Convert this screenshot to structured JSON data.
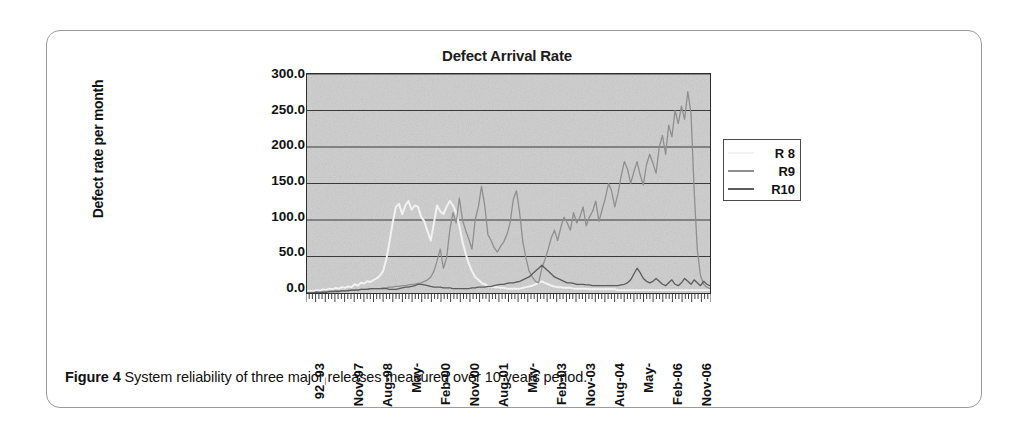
{
  "figure": {
    "caption_label": "Figure 4",
    "caption_text": "System reliability of three major releases measured over 10 years period."
  },
  "chart_data": {
    "type": "line",
    "title": "Defect Arrival Rate",
    "xlabel": "",
    "ylabel": "Defect rate per month",
    "ylim": [
      0,
      300
    ],
    "ytick_labels": [
      "300.0",
      "250.0",
      "200.0",
      "150.0",
      "100.0",
      "50.0",
      "0.0"
    ],
    "ytick_values": [
      300,
      250,
      200,
      150,
      100,
      50,
      0
    ],
    "grid": true,
    "grid_axis": "y",
    "plot_background": "#cfcfcf",
    "legend_position": "right",
    "x_tick_labels": [
      "92_93",
      "Nov-97",
      "Aug-98",
      "May-",
      "Feb-00",
      "Nov-00",
      "Aug-01",
      "May-",
      "Feb-03",
      "Nov-03",
      "Aug-04",
      "May-",
      "Feb-06",
      "Nov-06"
    ],
    "x_tick_positions": [
      0,
      12,
      21,
      30,
      39,
      48,
      57,
      66,
      75,
      84,
      93,
      102,
      111,
      120
    ],
    "n_points": 128,
    "series": [
      {
        "name": "R 8",
        "color": "#f2f2f2",
        "values": [
          2,
          3,
          2,
          4,
          3,
          5,
          4,
          6,
          5,
          7,
          6,
          8,
          7,
          9,
          8,
          12,
          10,
          14,
          13,
          16,
          15,
          18,
          20,
          24,
          30,
          46,
          70,
          96,
          118,
          122,
          108,
          120,
          126,
          114,
          120,
          118,
          104,
          98,
          84,
          72,
          96,
          120,
          112,
          108,
          118,
          126,
          120,
          110,
          92,
          70,
          54,
          40,
          30,
          22,
          18,
          14,
          12,
          10,
          9,
          8,
          8,
          7,
          7,
          6,
          6,
          6,
          6,
          6,
          7,
          8,
          9,
          10,
          12,
          14,
          16,
          14,
          12,
          10,
          9,
          8,
          8,
          7,
          7,
          7,
          6,
          6,
          6,
          6,
          6,
          5,
          5,
          5,
          5,
          5,
          5,
          5,
          5,
          5,
          4,
          4,
          4,
          4,
          4,
          4,
          4,
          4,
          4,
          4,
          4,
          4,
          4,
          4,
          4,
          4,
          4,
          4,
          4,
          4,
          4,
          4,
          4,
          4,
          4,
          4,
          4,
          4,
          4,
          4
        ]
      },
      {
        "name": "R9",
        "color": "#8f8f8f",
        "values": [
          1,
          1,
          1,
          2,
          1,
          2,
          2,
          2,
          2,
          3,
          3,
          3,
          3,
          4,
          4,
          4,
          4,
          5,
          5,
          5,
          6,
          6,
          6,
          6,
          7,
          7,
          8,
          8,
          9,
          9,
          10,
          10,
          11,
          12,
          12,
          13,
          14,
          16,
          18,
          22,
          30,
          44,
          60,
          34,
          48,
          86,
          110,
          96,
          130,
          100,
          86,
          74,
          60,
          100,
          118,
          146,
          120,
          80,
          72,
          62,
          56,
          64,
          70,
          80,
          96,
          128,
          140,
          110,
          70,
          48,
          30,
          22,
          16,
          14,
          34,
          46,
          60,
          76,
          86,
          72,
          90,
          104,
          96,
          86,
          110,
          96,
          104,
          118,
          92,
          104,
          112,
          126,
          98,
          114,
          130,
          150,
          140,
          118,
          136,
          160,
          180,
          170,
          150,
          166,
          180,
          162,
          148,
          176,
          190,
          178,
          164,
          200,
          216,
          190,
          230,
          214,
          250,
          232,
          256,
          238,
          276,
          246,
          140,
          60,
          24,
          12,
          8,
          6
        ]
      },
      {
        "name": "R10",
        "color": "#5c5c5c",
        "values": [
          0,
          0,
          0,
          1,
          1,
          1,
          1,
          2,
          2,
          2,
          2,
          3,
          3,
          3,
          4,
          4,
          4,
          5,
          5,
          5,
          6,
          6,
          6,
          6,
          6,
          6,
          5,
          5,
          5,
          6,
          7,
          8,
          8,
          9,
          10,
          12,
          12,
          11,
          10,
          9,
          8,
          8,
          8,
          7,
          7,
          7,
          6,
          6,
          6,
          6,
          6,
          6,
          7,
          7,
          8,
          8,
          8,
          9,
          9,
          10,
          11,
          12,
          12,
          13,
          14,
          14,
          15,
          16,
          18,
          20,
          22,
          26,
          30,
          34,
          38,
          34,
          30,
          26,
          22,
          20,
          18,
          16,
          14,
          14,
          13,
          12,
          12,
          12,
          11,
          11,
          10,
          10,
          10,
          10,
          10,
          10,
          10,
          10,
          10,
          11,
          12,
          14,
          18,
          26,
          34,
          28,
          20,
          16,
          14,
          16,
          20,
          16,
          12,
          10,
          14,
          18,
          12,
          10,
          14,
          20,
          16,
          12,
          18,
          14,
          10,
          16,
          12,
          10
        ]
      }
    ]
  }
}
